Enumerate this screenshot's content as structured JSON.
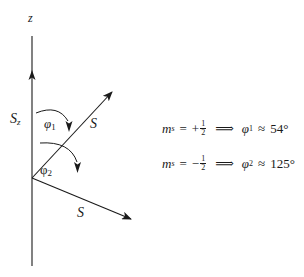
{
  "diagram": {
    "axis": {
      "label": "z",
      "component_label": "S",
      "component_sub": "z"
    },
    "vectors": [
      {
        "id": "spin-up",
        "label": "S",
        "angle_label": "φ",
        "angle_sub": "1"
      },
      {
        "id": "spin-down",
        "label": "S",
        "angle_label": "φ",
        "angle_sub": "2"
      }
    ],
    "equations": [
      {
        "lhs_var": "m",
        "lhs_sub": "s",
        "equals": "=",
        "sign": "+",
        "frac_num": "1",
        "frac_den": "2",
        "implies": "⟹",
        "rhs_var": "φ",
        "rhs_sub": "1",
        "approx": "≈",
        "value": "54°"
      },
      {
        "lhs_var": "m",
        "lhs_sub": "s",
        "equals": "=",
        "sign": "−",
        "frac_num": "1",
        "frac_den": "2",
        "implies": "⟹",
        "rhs_var": "φ",
        "rhs_sub": "2",
        "approx": "≈",
        "value": "125°"
      }
    ],
    "colors": {
      "ink": "#1a1a1a",
      "background": "#ffffff"
    }
  }
}
